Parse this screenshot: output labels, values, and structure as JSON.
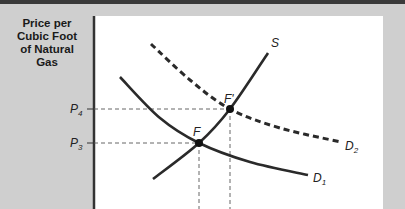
{
  "chart_data": {
    "type": "line",
    "title": "",
    "ylabel": "Price per Cubic Foot of Natural Gas",
    "xlabel": "",
    "grid": false,
    "series": [
      {
        "name": "S",
        "style": "solid",
        "points": [
          [
            153,
            179
          ],
          [
            199,
            143
          ],
          [
            230,
            109
          ],
          [
            268,
            53
          ]
        ]
      },
      {
        "name": "D1",
        "style": "solid",
        "points": [
          [
            120,
            77
          ],
          [
            160,
            118
          ],
          [
            199,
            143
          ],
          [
            250,
            162
          ],
          [
            308,
            175
          ]
        ]
      },
      {
        "name": "D2",
        "style": "dashed",
        "points": [
          [
            151,
            44
          ],
          [
            190,
            80
          ],
          [
            230,
            109
          ],
          [
            280,
            128
          ],
          [
            341,
            142
          ]
        ]
      }
    ],
    "equilibria": [
      {
        "label": "F",
        "x": 199,
        "y": 143,
        "price_label": "P3"
      },
      {
        "label": "F'",
        "x": 230,
        "y": 109,
        "price_label": "P4"
      }
    ],
    "price_levels": [
      {
        "label": "P4",
        "y": 109
      },
      {
        "label": "P3",
        "y": 143
      }
    ]
  },
  "labels": {
    "ylabel_lines": [
      "Price per",
      "Cubic Foot",
      "of Natural",
      "Gas"
    ],
    "p4": "P",
    "p4_sub": "4",
    "p3": "P",
    "p3_sub": "3",
    "s": "S",
    "d1": "D",
    "d1_sub": "1",
    "d2": "D",
    "d2_sub": "2",
    "f": "F",
    "fprime": "F'"
  }
}
